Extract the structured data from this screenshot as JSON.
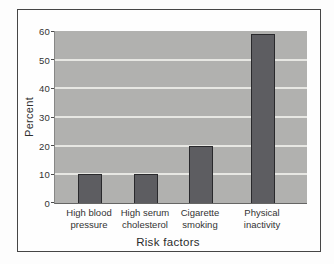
{
  "figure": {
    "frame_border_color": "#464646",
    "background_color": "#fefefe"
  },
  "chart_data": {
    "type": "bar",
    "categories": [
      "High blood\npressure",
      "High serum\ncholesterol",
      "Cigarette\nsmoking",
      "Physical\ninactivity"
    ],
    "values": [
      10,
      10,
      20,
      59
    ],
    "title": "",
    "xlabel": "Risk factors",
    "ylabel": "Percent",
    "ylim": [
      0,
      60
    ],
    "yticks": [
      0,
      10,
      20,
      30,
      40,
      50,
      60
    ],
    "grid": true,
    "legend": "none",
    "colors": {
      "plot_bg": "#b1b1af",
      "bar_fill": "#5d5d61",
      "bar_border": "#29292c",
      "gridline": "#e7e7e3",
      "tick_text": "#333333",
      "axis_text": "#2f2f2f"
    }
  }
}
